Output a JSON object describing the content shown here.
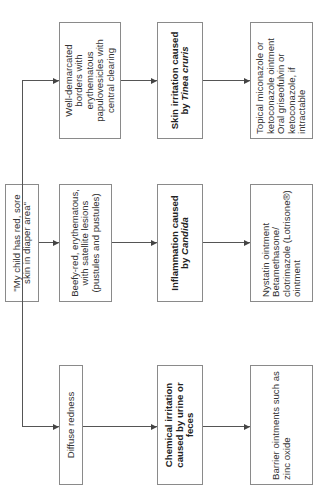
{
  "diagram": {
    "orientation": "rotated 90° counter-clockwise",
    "root": {
      "text": "\"My child has red, sore skin in diaper area\""
    },
    "branches": [
      {
        "finding": "Well-demarcated borders with erythematous papulovesicles with central clearing",
        "diagnosis_prefix": "Skin irritation caused by ",
        "diagnosis_organism": "Tinea cruris",
        "treatment": "Topical miconazole or ketoconazole ointment\nOral griseofulvin or ketoconazole, if intractable"
      },
      {
        "finding": "Beefy-red, erythematous, with satellite lesions (pustules and pustules)",
        "diagnosis_prefix": "Inflammation caused by ",
        "diagnosis_organism": "Candida",
        "treatment": "Nystatin ointment\nBetamethasone/ clotrimazole (Lotrisone®) ointment"
      },
      {
        "finding": "Diffuse redness",
        "diagnosis_prefix": "Chemical irritation caused by urine or feces",
        "diagnosis_organism": "",
        "treatment": "Barrier ointments such as zinc oxide"
      }
    ]
  }
}
